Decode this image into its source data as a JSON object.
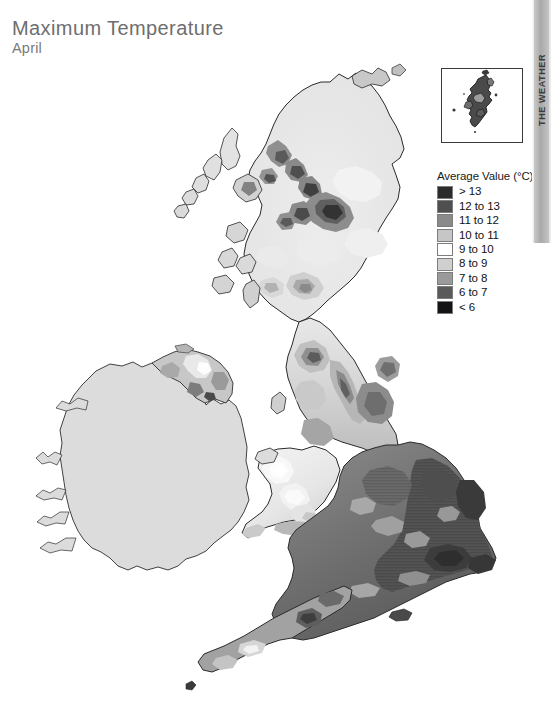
{
  "page": {
    "background_color": "#ffffff"
  },
  "header": {
    "title": "Maximum Temperature",
    "subtitle": "April"
  },
  "edge_tab": {
    "label": "THE WEATHER",
    "color": "#bdbdbd"
  },
  "inset": {
    "name": "shetland-islands-inset",
    "border_color": "#3a3a3a"
  },
  "legend": {
    "title": "Average Value (°C)",
    "items": [
      {
        "label": "> 13",
        "color": "#2b2b2b"
      },
      {
        "label": "12 to 13",
        "color": "#4f4f4f"
      },
      {
        "label": "11 to 12",
        "color": "#8a8a8a"
      },
      {
        "label": "10 to 11",
        "color": "#c6c6c6"
      },
      {
        "label": "9 to 10",
        "color": "#ffffff"
      },
      {
        "label": "8 to 9",
        "color": "#d0d0d0"
      },
      {
        "label": "7 to 8",
        "color": "#9a9a9a"
      },
      {
        "label": "6 to 7",
        "color": "#5a5a5a"
      },
      {
        "label": "< 6",
        "color": "#141414"
      }
    ]
  },
  "chart_data": {
    "type": "heatmap",
    "title": "Maximum Temperature",
    "subtitle": "April",
    "variable": "Maximum Temperature",
    "period": "April",
    "units": "°C",
    "legend_title": "Average Value (°C)",
    "region": "United Kingdom and Ireland",
    "projection_note": "Shetland Islands shown in separate inset box",
    "categories": [
      "> 13",
      "12 to 13",
      "11 to 12",
      "10 to 11",
      "9 to 10",
      "8 to 9",
      "7 to 8",
      "6 to 7",
      "< 6"
    ],
    "category_colors": [
      "#2b2b2b",
      "#4f4f4f",
      "#8a8a8a",
      "#c6c6c6",
      "#ffffff",
      "#d0d0d0",
      "#9a9a9a",
      "#5a5a5a",
      "#141414"
    ],
    "grid": false,
    "legend_position": "right",
    "xlabel": "",
    "ylabel": "",
    "regions": [
      {
        "name": "South East England",
        "class": "> 13"
      },
      {
        "name": "East Anglia",
        "class": "> 13"
      },
      {
        "name": "Greater London",
        "class": "> 13"
      },
      {
        "name": "Midlands",
        "class": "12 to 13"
      },
      {
        "name": "South West England lowlands",
        "class": "12 to 13"
      },
      {
        "name": "Lincolnshire",
        "class": "12 to 13"
      },
      {
        "name": "Cheshire Plain",
        "class": "11 to 12"
      },
      {
        "name": "Yorkshire lowlands",
        "class": "11 to 12"
      },
      {
        "name": "Welsh lowlands",
        "class": "10 to 11"
      },
      {
        "name": "Cornwall",
        "class": "10 to 11"
      },
      {
        "name": "Northern Ireland lowlands",
        "class": "10 to 11"
      },
      {
        "name": "Lancashire coast",
        "class": "10 to 11"
      },
      {
        "name": "Scottish lowlands",
        "class": "9 to 10"
      },
      {
        "name": "Welsh uplands",
        "class": "8 to 9"
      },
      {
        "name": "Pennines",
        "class": "8 to 9"
      },
      {
        "name": "Lake District",
        "class": "7 to 8"
      },
      {
        "name": "Southern Uplands",
        "class": "7 to 8"
      },
      {
        "name": "Grampian Mountains",
        "class": "6 to 7"
      },
      {
        "name": "Scottish Highlands peaks",
        "class": "< 6"
      },
      {
        "name": "Cairngorms",
        "class": "< 6"
      },
      {
        "name": "Republic of Ireland",
        "class": "no data"
      }
    ]
  }
}
